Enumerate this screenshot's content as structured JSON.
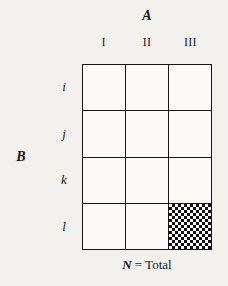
{
  "figure": {
    "column_variable": "A",
    "row_variable": "B",
    "column_headers": [
      {
        "label": "I"
      },
      {
        "label": "II"
      },
      {
        "label": "III"
      }
    ],
    "row_headers": [
      {
        "label": "i"
      },
      {
        "label": "j"
      },
      {
        "label": "k"
      },
      {
        "label": "l"
      }
    ],
    "caption": {
      "symbol": "N",
      "equals": "=",
      "word": "Total"
    },
    "grid": {
      "rows": 4,
      "columns": 3,
      "cells": [
        [
          {
            "value": "",
            "shaded": false
          },
          {
            "value": "",
            "shaded": false
          },
          {
            "value": "",
            "shaded": false
          }
        ],
        [
          {
            "value": "",
            "shaded": false
          },
          {
            "value": "",
            "shaded": false
          },
          {
            "value": "",
            "shaded": false
          }
        ],
        [
          {
            "value": "",
            "shaded": false
          },
          {
            "value": "",
            "shaded": false
          },
          {
            "value": "",
            "shaded": false
          }
        ],
        [
          {
            "value": "",
            "shaded": false
          },
          {
            "value": "",
            "shaded": false
          },
          {
            "value": "",
            "shaded": true
          }
        ]
      ],
      "shaded_cell": {
        "row": "l",
        "column": "III"
      }
    },
    "colors": {
      "page_background": "#f2f1ee",
      "grid_background": "#fbfaf8",
      "line": "#16161a",
      "hatch": "#111111",
      "text": "#1a1a1a"
    }
  }
}
